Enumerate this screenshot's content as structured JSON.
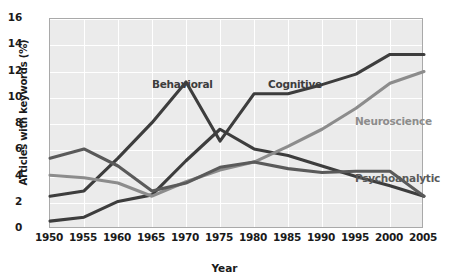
{
  "chart_data": {
    "type": "line",
    "title": "",
    "xlabel": "Year",
    "ylabel": "Articles with keywords (%)",
    "x": [
      1950,
      1955,
      1960,
      1965,
      1970,
      1975,
      1980,
      1985,
      1990,
      1995,
      2000,
      2005
    ],
    "xtick_labels": [
      "1950",
      "1955",
      "1960",
      "1965",
      "1970",
      "1975",
      "1980",
      "1985",
      "1990",
      "1995",
      "2000",
      "2005"
    ],
    "ytick_labels": [
      "0",
      "2",
      "4",
      "6",
      "8",
      "10",
      "12",
      "14",
      "16"
    ],
    "ytick_values": [
      0,
      2,
      4,
      6,
      8,
      10,
      12,
      14,
      16
    ],
    "xlim": [
      1950,
      2005
    ],
    "ylim": [
      0,
      16
    ],
    "grid": true,
    "legend": "inline-annotations",
    "plot_background": "#ebebeb",
    "series": [
      {
        "name": "Behavioral",
        "color": "#3d3d3d",
        "values": [
          0.6,
          0.9,
          2.1,
          2.6,
          5.2,
          7.6,
          6.1,
          5.6,
          4.8,
          4.0,
          3.3,
          2.5
        ],
        "label_x": 152,
        "label_y": 78
      },
      {
        "name": "Cognitive",
        "color": "#3d3d3d",
        "values": [
          2.5,
          2.9,
          5.4,
          8.1,
          11.2,
          6.7,
          10.3,
          10.3,
          11.0,
          11.8,
          13.3,
          13.3
        ],
        "label_x": 268,
        "label_y": 78
      },
      {
        "name": "Neuroscience",
        "color": "#8c8c8c",
        "values": [
          4.1,
          3.9,
          3.5,
          2.5,
          3.6,
          4.5,
          5.1,
          6.3,
          7.6,
          9.2,
          11.1,
          12.0
        ],
        "label_x": 355,
        "label_y": 115
      },
      {
        "name": "Psychoanalytic",
        "color": "#5a5a5a",
        "values": [
          5.4,
          6.1,
          4.8,
          2.9,
          3.5,
          4.7,
          5.1,
          4.6,
          4.3,
          4.4,
          4.4,
          2.5
        ],
        "label_x": 355,
        "label_y": 172
      }
    ]
  }
}
